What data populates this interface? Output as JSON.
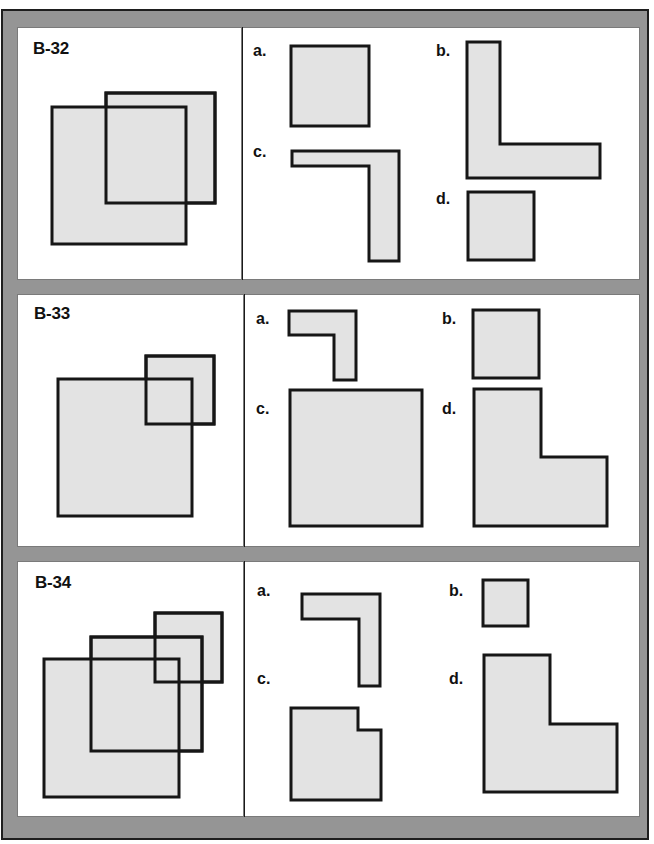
{
  "problems": [
    {
      "id": "B-32",
      "question": {
        "label": "B-32",
        "rects": [
          {
            "name": "back-square",
            "x1": 106,
            "y1": 93,
            "x2": 215,
            "y2": 203
          },
          {
            "name": "front-square",
            "x1": 52,
            "y1": 107,
            "x2": 186,
            "y2": 244
          }
        ]
      },
      "options": [
        {
          "label": "a.",
          "shape": "square",
          "points": [
            [
              291,
              46
            ],
            [
              369,
              46
            ],
            [
              369,
              126
            ],
            [
              291,
              126
            ]
          ]
        },
        {
          "label": "b.",
          "shape": "L-shape",
          "points": [
            [
              467,
              42
            ],
            [
              500,
              42
            ],
            [
              500,
              144
            ],
            [
              600,
              144
            ],
            [
              600,
              178
            ],
            [
              467,
              178
            ]
          ]
        },
        {
          "label": "c.",
          "shape": "inverted-L-shape",
          "points": [
            [
              292,
              151
            ],
            [
              399,
              151
            ],
            [
              399,
              261
            ],
            [
              369,
              261
            ],
            [
              369,
              166
            ],
            [
              292,
              166
            ]
          ]
        },
        {
          "label": "d.",
          "shape": "square",
          "points": [
            [
              468,
              192
            ],
            [
              534,
              192
            ],
            [
              534,
              260
            ],
            [
              468,
              260
            ]
          ]
        }
      ]
    },
    {
      "id": "B-33",
      "question": {
        "label": "B-33",
        "rects": [
          {
            "name": "small-back-square",
            "x1": 146,
            "y1": 356,
            "x2": 214,
            "y2": 424
          },
          {
            "name": "large-front-square",
            "x1": 58,
            "y1": 379,
            "x2": 192,
            "y2": 516
          }
        ]
      },
      "options": [
        {
          "label": "a.",
          "shape": "inverted-L-shape",
          "points": [
            [
              289,
              311
            ],
            [
              356,
              311
            ],
            [
              356,
              380
            ],
            [
              334,
              380
            ],
            [
              334,
              335
            ],
            [
              289,
              335
            ]
          ]
        },
        {
          "label": "b.",
          "shape": "square",
          "points": [
            [
              473,
              310
            ],
            [
              539,
              310
            ],
            [
              539,
              378
            ],
            [
              473,
              378
            ]
          ]
        },
        {
          "label": "c.",
          "shape": "square",
          "points": [
            [
              290,
              390
            ],
            [
              422,
              390
            ],
            [
              422,
              526
            ],
            [
              290,
              526
            ]
          ]
        },
        {
          "label": "d.",
          "shape": "L-shape",
          "points": [
            [
              474,
              389
            ],
            [
              541,
              389
            ],
            [
              541,
              457
            ],
            [
              607,
              457
            ],
            [
              607,
              526
            ],
            [
              474,
              526
            ]
          ]
        }
      ]
    },
    {
      "id": "B-34",
      "question": {
        "label": "B-34",
        "rects": [
          {
            "name": "small-back-square",
            "x1": 155,
            "y1": 613,
            "x2": 222,
            "y2": 682
          },
          {
            "name": "middle-square",
            "x1": 91,
            "y1": 637,
            "x2": 202,
            "y2": 751
          },
          {
            "name": "large-front-square",
            "x1": 44,
            "y1": 659,
            "x2": 179,
            "y2": 797
          }
        ]
      },
      "options": [
        {
          "label": "a.",
          "shape": "inverted-L-shape",
          "points": [
            [
              302,
              594
            ],
            [
              380,
              594
            ],
            [
              380,
              686
            ],
            [
              359,
              686
            ],
            [
              359,
              619
            ],
            [
              302,
              619
            ]
          ]
        },
        {
          "label": "b.",
          "shape": "square",
          "points": [
            [
              483,
              580
            ],
            [
              528,
              580
            ],
            [
              528,
              626
            ],
            [
              483,
              626
            ]
          ]
        },
        {
          "label": "c.",
          "shape": "notched-square",
          "points": [
            [
              291,
              708
            ],
            [
              358,
              708
            ],
            [
              358,
              730
            ],
            [
              381,
              730
            ],
            [
              381,
              800
            ],
            [
              291,
              800
            ]
          ]
        },
        {
          "label": "d.",
          "shape": "L-shape",
          "points": [
            [
              484,
              655
            ],
            [
              550,
              655
            ],
            [
              550,
              724
            ],
            [
              617,
              724
            ],
            [
              617,
              792
            ],
            [
              484,
              792
            ]
          ]
        }
      ]
    }
  ],
  "colors": {
    "frame": "#959595",
    "frame_border": "#1e1e1e",
    "panel": "#ffffff",
    "shape_fill": "#e3e3e3",
    "shape_stroke": "#161616"
  }
}
